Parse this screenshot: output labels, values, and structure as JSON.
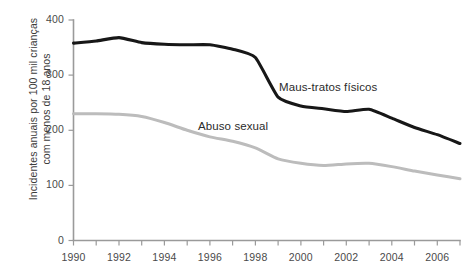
{
  "chart_data": {
    "type": "line",
    "title": "",
    "subtitle": "",
    "xlabel": "",
    "ylabel": "Incidentes anuais por 100 mil crianças com menos de 18 anos",
    "ylabel_lines": [
      "Incidentes anuais por 100 mil crianças",
      "com menos de 18 anos"
    ],
    "x": [
      1990,
      1991,
      1992,
      1993,
      1994,
      1995,
      1996,
      1997,
      1998,
      1999,
      2000,
      2001,
      2002,
      2003,
      2004,
      2005,
      2006,
      2007
    ],
    "xlim": [
      1990,
      2007
    ],
    "ylim": [
      0,
      400
    ],
    "yticks": [
      0,
      100,
      200,
      300,
      400
    ],
    "ytick_labels": [
      "0",
      "100",
      "200",
      "300",
      "400"
    ],
    "xticks": [
      1990,
      1991,
      1992,
      1993,
      1994,
      1995,
      1996,
      1997,
      1998,
      1999,
      2000,
      2001,
      2002,
      2003,
      2004,
      2005,
      2006,
      2007
    ],
    "xtick_labels_shown": [
      "1990",
      "1992",
      "1994",
      "1996",
      "1998",
      "2000",
      "2002",
      "2004",
      "2006"
    ],
    "xtick_labeled_years": [
      1990,
      1992,
      1994,
      1996,
      1998,
      2000,
      2002,
      2004,
      2006
    ],
    "grid": false,
    "legend_position": "inline-annotations",
    "series": [
      {
        "name": "Maus-tratos físicos",
        "color": "#171717",
        "annotation_label": "Maus-tratos físicos",
        "values": [
          358,
          362,
          368,
          359,
          356,
          355,
          355,
          347,
          332,
          260,
          244,
          239,
          234,
          238,
          222,
          205,
          192,
          176
        ]
      },
      {
        "name": "Abuso sexual",
        "color": "#bcbcbc",
        "annotation_label": "Abuso sexual",
        "values": [
          230,
          230,
          229,
          225,
          214,
          200,
          188,
          180,
          168,
          148,
          140,
          136,
          139,
          140,
          134,
          126,
          119,
          112
        ]
      }
    ]
  },
  "axis": {
    "axis_color": "#9a9a9a",
    "tick_label_color": "#4a4a4a",
    "annotation_color": "#2b2b2b"
  }
}
